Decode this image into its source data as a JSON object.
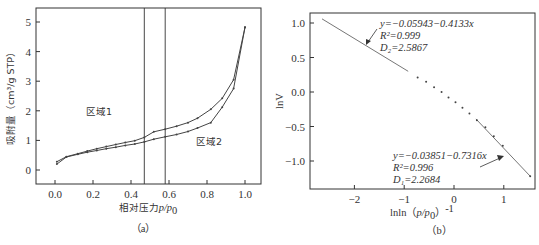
{
  "chart_data": [
    {
      "type": "line",
      "panel": "a",
      "caption": "（a）",
      "xlabel": "相对压力p/p0",
      "ylabel": "吸附量（cm³/g STP）",
      "xlim": [
        -0.1,
        1.1
      ],
      "ylim": [
        -0.5,
        5.5
      ],
      "xticks": [
        "0.0",
        "0.2",
        "0.4",
        "0.6",
        "0.8",
        "1.0"
      ],
      "yticks": [
        "0",
        "1",
        "2",
        "3",
        "4",
        "5"
      ],
      "vertical_lines": [
        0.47,
        0.58
      ],
      "region_labels": [
        {
          "text": "区域1",
          "x": 0.31,
          "y": 2.0
        },
        {
          "text": "区域2",
          "x": 0.76,
          "y": 0.97
        }
      ],
      "series": [
        {
          "name": "desorption",
          "x": [
            0.01,
            0.06,
            0.12,
            0.17,
            0.22,
            0.27,
            0.32,
            0.37,
            0.42,
            0.47,
            0.52,
            0.58,
            0.64,
            0.7,
            0.75,
            0.82,
            0.88,
            0.94,
            1.0
          ],
          "y": [
            0.28,
            0.45,
            0.55,
            0.64,
            0.72,
            0.79,
            0.86,
            0.93,
            0.99,
            1.1,
            1.29,
            1.38,
            1.48,
            1.6,
            1.75,
            2.05,
            2.42,
            3.05,
            4.82
          ]
        },
        {
          "name": "adsorption",
          "x": [
            0.01,
            0.06,
            0.12,
            0.17,
            0.22,
            0.27,
            0.32,
            0.37,
            0.42,
            0.47,
            0.52,
            0.58,
            0.64,
            0.7,
            0.75,
            0.82,
            0.88,
            0.94,
            1.0
          ],
          "y": [
            0.2,
            0.44,
            0.53,
            0.6,
            0.66,
            0.72,
            0.77,
            0.83,
            0.88,
            0.95,
            1.04,
            1.12,
            1.2,
            1.3,
            1.42,
            1.6,
            2.12,
            2.75,
            4.82
          ]
        }
      ]
    },
    {
      "type": "scatter",
      "panel": "b",
      "caption": "（b）",
      "xlabel": "lnln(p/p0)⁻¹",
      "ylabel": "lnV",
      "xlim": [
        -2.9,
        1.6
      ],
      "ylim": [
        -1.4,
        1.15
      ],
      "xticks": [
        "-2",
        "-1",
        "0",
        "1"
      ],
      "yticks": [
        "1.0",
        "0.5",
        "0.0",
        "-0.5",
        "-1.0"
      ],
      "points": {
        "x": [
          -0.73,
          -0.56,
          -0.4,
          -0.25,
          -0.11,
          0.03,
          0.17,
          0.31,
          0.46,
          0.63,
          0.8,
          0.98,
          1.53
        ],
        "y": [
          0.21,
          0.15,
          0.07,
          0.0,
          -0.08,
          -0.15,
          -0.23,
          -0.31,
          -0.41,
          -0.51,
          -0.64,
          -0.78,
          -1.22
        ]
      },
      "fits": [
        {
          "name": "region2",
          "equation": "y=−0.05943−0.4133x",
          "r2": "R²=0.999",
          "d": "D₂=2.5867",
          "x_range": [
            -2.65,
            -0.92
          ],
          "y_range": [
            1.06,
            0.3
          ]
        },
        {
          "name": "region1",
          "equation": "y=−0.03851−0.7316x",
          "r2": "R²=0.996",
          "d": "D₁=2.2684",
          "x_range": [
            0.44,
            1.53
          ],
          "y_range": [
            -0.39,
            -1.22
          ]
        }
      ]
    }
  ],
  "labels": {
    "a": {
      "caption": "（a）",
      "ylabel": "吸附量（cm³/g STP）",
      "xlabel_main": "相对压力",
      "xlabel_var": "p/p",
      "xlabel_sub": "0",
      "region1": "区域1",
      "region2": "区域2",
      "xticks": [
        "0.0",
        "0.2",
        "0.4",
        "0.6",
        "0.8",
        "1.0"
      ],
      "yticks": [
        "0",
        "1",
        "2",
        "3",
        "4",
        "5"
      ]
    },
    "b": {
      "caption": "（b）",
      "ylabel": "lnV",
      "xlabel_pre": "lnln（",
      "xlabel_var": "p/p",
      "xlabel_sub": "0",
      "xlabel_post": "）",
      "xlabel_sup": "-1",
      "xticks": [
        "−2",
        "−1",
        "0",
        "1"
      ],
      "yticks": [
        "1.0",
        "0.5",
        "0.0",
        "−0.5",
        "−1.0"
      ],
      "fit_top_eq": "y=−0.05943−0.4133x",
      "fit_top_r2": "R²=0.999",
      "fit_top_d": "D₂=2.5867",
      "fit_bottom_eq": "y=−0.03851−0.7316x",
      "fit_bottom_r2": "R²=0.996",
      "fit_bottom_d": "D₁=2.2684"
    }
  },
  "colors": {
    "axis": "#333333",
    "line": "#444444",
    "fit_line": "#666666"
  }
}
